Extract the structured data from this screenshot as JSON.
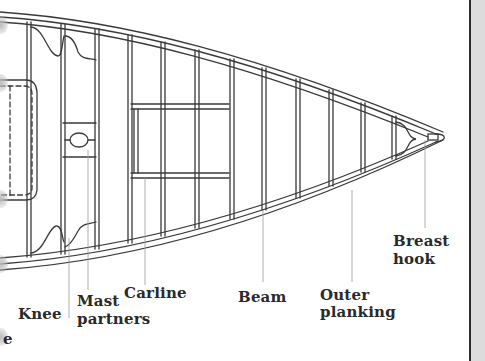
{
  "diagram": {
    "colors": {
      "line": "#3a3a3a",
      "leader": "#9a9a9a",
      "text": "#2a2a2a",
      "background": "#ffffff",
      "page_edge": "#dcdcdc",
      "page_edge_border": "#2b2b2b"
    },
    "labels": {
      "knee": "Knee",
      "mast_partners_line1": "Mast",
      "mast_partners_line2": "partners",
      "carline": "Carline",
      "beam": "Beam",
      "outer_planking_line1": "Outer",
      "outer_planking_line2": "planking",
      "breast_hook_line1": "Breast",
      "breast_hook_line2": "hook",
      "cut_off_fragment": "e"
    }
  }
}
